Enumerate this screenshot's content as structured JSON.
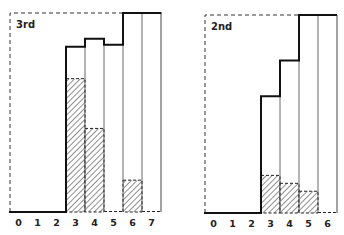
{
  "chart_data": [
    {
      "type": "bar",
      "title": "3rd",
      "categories": [
        "0",
        "1",
        "2",
        "3",
        "4",
        "5",
        "6",
        "7"
      ],
      "series": [
        {
          "name": "total (outline)",
          "values": [
            0,
            0,
            0,
            83,
            87,
            84,
            100,
            100
          ]
        },
        {
          "name": "hatched",
          "values": [
            0,
            0,
            0,
            67,
            42,
            0,
            16,
            0
          ]
        }
      ],
      "xlabel": "",
      "ylabel": "",
      "ylim": [
        0,
        100
      ],
      "grid": false,
      "legend": "none"
    },
    {
      "type": "bar",
      "title": "2nd",
      "categories": [
        "0",
        "1",
        "2",
        "3",
        "4",
        "5",
        "6"
      ],
      "series": [
        {
          "name": "total (outline)",
          "values": [
            0,
            0,
            0,
            59,
            77,
            100,
            100
          ]
        },
        {
          "name": "hatched",
          "values": [
            0,
            0,
            0,
            19,
            15,
            11,
            0
          ]
        }
      ],
      "xlabel": "",
      "ylabel": "",
      "ylim": [
        0,
        100
      ],
      "grid": false,
      "legend": "none"
    }
  ],
  "layout": [
    {
      "left": 10,
      "top": 13,
      "bottom": 212,
      "right": 162,
      "bin_width": 19.0,
      "first_bin_x": 9
    },
    {
      "left": 205,
      "top": 15,
      "bottom": 213,
      "right": 337,
      "bin_width": 19.0,
      "first_bin_x": 204
    }
  ]
}
